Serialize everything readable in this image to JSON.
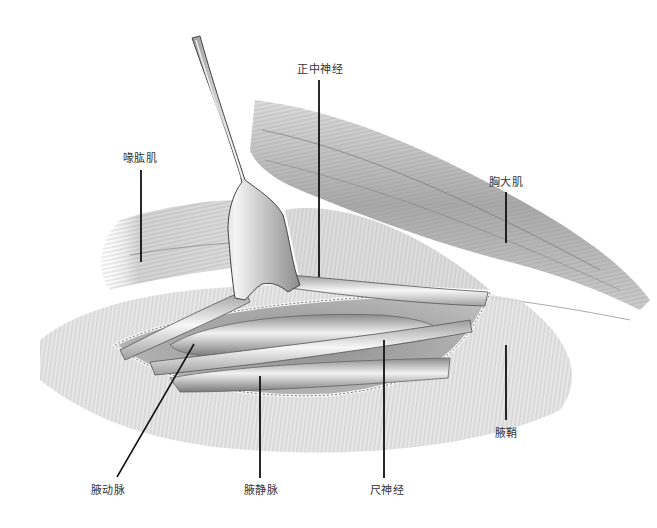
{
  "figure": {
    "type": "anatomical-illustration",
    "colors": {
      "background": "#ffffff",
      "tissue_light": "#e8e8e8",
      "tissue_mid": "#b5b5b5",
      "tissue_dark": "#6e6e6e",
      "leader_line": "#111111",
      "label_text": "#333333"
    }
  },
  "labels": {
    "median_nerve": "正中神经",
    "coracobrachialis": "喙肱肌",
    "pectoralis_major": "胸大肌",
    "axillary_sheath": "腋鞘",
    "axillary_artery": "腋动脉",
    "axillary_vein": "腋静脉",
    "ulnar_nerve": "尺神经"
  }
}
